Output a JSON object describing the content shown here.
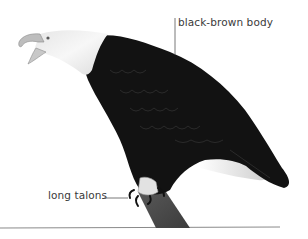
{
  "diagram": {
    "labels": [
      {
        "id": "body",
        "text": "black-brown body"
      },
      {
        "id": "talons",
        "text": "long talons"
      }
    ]
  },
  "colors": {
    "background": "#ffffff",
    "label_text": "#3a3a3a",
    "leader_line": "#555555",
    "ground_line": "#8a8a8a",
    "head": "#f2f2f2",
    "body": "#121212",
    "branch": "#4a4a4a"
  }
}
